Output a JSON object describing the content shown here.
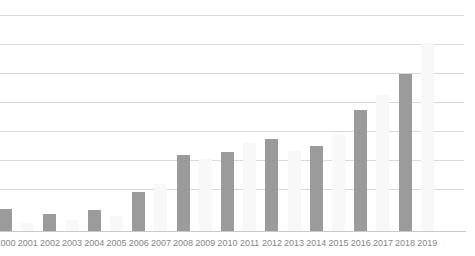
{
  "chart_data": {
    "type": "bar",
    "title": "",
    "subtitle": "",
    "xlabel": "",
    "ylabel": "",
    "grid": true,
    "legend": "none",
    "ylim": [
      0,
      7.5
    ],
    "gridline_values": [
      1,
      2,
      3,
      4,
      5,
      6,
      7
    ],
    "categories": [
      "2000",
      "2001",
      "2002",
      "2003",
      "2004",
      "2005",
      "2006",
      "2007",
      "2008",
      "2009",
      "2010",
      "2011",
      "2012",
      "2013",
      "2014",
      "2015",
      "2016",
      "2017",
      "2018",
      "2019"
    ],
    "values": [
      0.76,
      0.3,
      0.59,
      0.38,
      0.72,
      0.52,
      1.35,
      1.62,
      2.62,
      2.34,
      2.72,
      3.05,
      3.17,
      2.76,
      2.93,
      3.4,
      4.17,
      4.69,
      5.41,
      6.48
    ],
    "bar_tops_px": [
      209,
      223,
      214,
      220,
      210,
      216,
      192,
      184,
      155,
      159,
      152,
      143,
      139,
      151,
      146,
      135,
      110,
      95,
      74,
      43
    ],
    "bar_shades": [
      "dark",
      "light",
      "dark",
      "light",
      "dark",
      "light",
      "dark",
      "light",
      "dark",
      "light",
      "dark",
      "light",
      "dark",
      "light",
      "dark",
      "light",
      "dark",
      "light",
      "dark",
      "light"
    ],
    "colors": {
      "bar_dark": "#9b9b9b",
      "bar_light": "#f8f8f8",
      "gridline": "#d9d9d9",
      "axis": "#c9c9c9",
      "label_text": "#868686",
      "background": "#ffffff"
    }
  }
}
